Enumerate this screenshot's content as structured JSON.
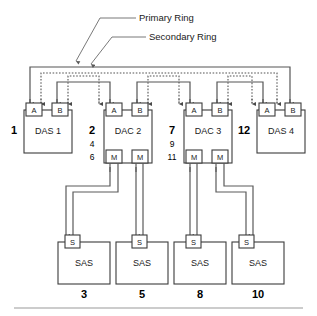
{
  "diagram": {
    "type": "ring-topology",
    "legend": {
      "primary_ring_label": "Primary Ring",
      "secondary_ring_label": "Secondary Ring"
    },
    "port_labels": {
      "a": "A",
      "b": "B",
      "m": "M",
      "s": "S"
    },
    "units": [
      {
        "id": "das1",
        "name": "DAS 1",
        "callout_bold": "1",
        "callout_extra": [],
        "ports_top": [
          "A",
          "B"
        ],
        "ports_bottom": []
      },
      {
        "id": "dac2",
        "name": "DAC 2",
        "callout_bold": "2",
        "callout_extra": [
          "4",
          "6"
        ],
        "ports_top": [
          "A",
          "B"
        ],
        "ports_bottom": [
          "M",
          "M"
        ]
      },
      {
        "id": "dac3",
        "name": "DAC 3",
        "callout_bold": "7",
        "callout_extra": [
          "9",
          "11"
        ],
        "ports_top": [
          "A",
          "B"
        ],
        "ports_bottom": [
          "M",
          "M"
        ]
      },
      {
        "id": "das4",
        "name": "DAS 4",
        "callout_bold": "12",
        "callout_extra": [],
        "ports_top": [
          "A",
          "B"
        ],
        "ports_bottom": []
      }
    ],
    "storage": [
      {
        "id": "sas3",
        "name": "SAS",
        "callout": "3",
        "port": "S"
      },
      {
        "id": "sas5",
        "name": "SAS",
        "callout": "5",
        "port": "S"
      },
      {
        "id": "sas8",
        "name": "SAS",
        "callout": "8",
        "port": "S"
      },
      {
        "id": "sas10",
        "name": "SAS",
        "callout": "10",
        "port": "S"
      }
    ],
    "colors": {
      "line": "#555555",
      "box_stroke": "#3b3b3b",
      "text": "#1a1a1a",
      "rule": "#9a9a9a",
      "background": "#ffffff"
    }
  }
}
